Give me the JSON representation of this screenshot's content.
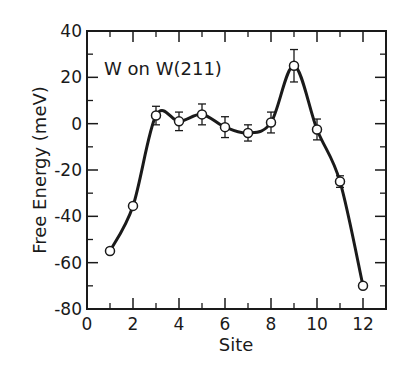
{
  "chart_data": {
    "type": "scatter",
    "title": "",
    "annotation": "W on W(211)",
    "xlabel": "Site",
    "ylabel": "Free Energy  (meV)",
    "xlim": [
      0,
      13
    ],
    "ylim": [
      -80,
      40
    ],
    "xticks": [
      0,
      2,
      4,
      6,
      8,
      10,
      12
    ],
    "xticks_minor": [
      1,
      3,
      5,
      7,
      9,
      11,
      13
    ],
    "yticks": [
      40,
      20,
      0,
      -20,
      -40,
      -60,
      -80
    ],
    "yticks_minor": [
      30,
      10,
      -10,
      -30,
      -50,
      -70
    ],
    "grid": false,
    "legend": null,
    "series": [
      {
        "name": "W on W(211)",
        "marker": "open-circle",
        "line": "smooth-fit",
        "x": [
          1,
          2,
          3,
          4,
          5,
          6,
          7,
          8,
          9,
          10,
          11,
          12
        ],
        "values": [
          -55,
          -35.5,
          3.5,
          1,
          4,
          -1.5,
          -4,
          0.5,
          25,
          -2.5,
          -25,
          -70
        ],
        "error": [
          1.5,
          2,
          4,
          4,
          4.5,
          4.5,
          3.5,
          4.5,
          7,
          4.5,
          2.5,
          1.5
        ]
      }
    ]
  },
  "labels": {
    "annotation": "W on W(211)",
    "xlabel": "Site",
    "ylabel": "Free Energy  (meV)",
    "xtick": [
      "0",
      "2",
      "4",
      "6",
      "8",
      "10",
      "12"
    ],
    "ytick": [
      "40",
      "20",
      "0",
      "-20",
      "-40",
      "-60",
      "-80"
    ]
  },
  "colors": {
    "ink": "#1a1a1a",
    "background": "#ffffff"
  }
}
